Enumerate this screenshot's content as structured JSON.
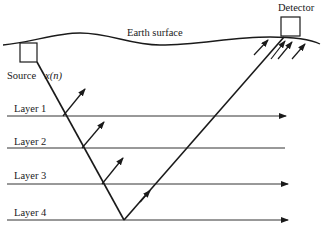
{
  "diagram": {
    "labels": {
      "earth_surface": "Earth surface",
      "detector": "Detector",
      "source": "Source",
      "signal": "x(n)",
      "layers": [
        "Layer 1",
        "Layer 2",
        "Layer 3",
        "Layer 4"
      ]
    },
    "colors": {
      "ink": "#1a1a1a",
      "background": "#ffffff"
    }
  }
}
